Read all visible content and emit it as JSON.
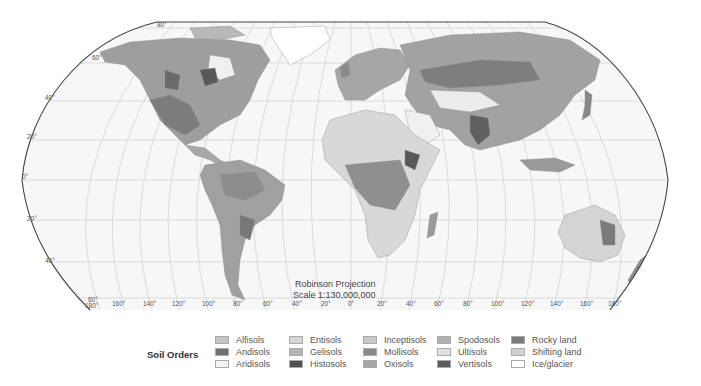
{
  "map": {
    "title": "Soil Orders",
    "projection_label": "Robinson Projection",
    "scale_label": "Scale 1:130,000,000",
    "ocean_color": "#f7f7f7",
    "graticule_color": "#c8c8c8",
    "border_color": "#444444",
    "latitude_labels": [
      {
        "text": "80°",
        "x": 157,
        "y": 27
      },
      {
        "text": "60°",
        "x": 92,
        "y": 60
      },
      {
        "text": "40°",
        "x": 45,
        "y": 100
      },
      {
        "text": "20°",
        "x": 27,
        "y": 139
      },
      {
        "text": "0°",
        "x": 22,
        "y": 179
      },
      {
        "text": "20°",
        "x": 27,
        "y": 221
      },
      {
        "text": "40°",
        "x": 45,
        "y": 263
      },
      {
        "text": "60°",
        "x": 88,
        "y": 302
      }
    ],
    "longitude_labels": [
      {
        "text": "180°",
        "x": 85
      },
      {
        "text": "160°",
        "x": 112
      },
      {
        "text": "140°",
        "x": 143
      },
      {
        "text": "120°",
        "x": 172
      },
      {
        "text": "100°",
        "x": 202
      },
      {
        "text": "80°",
        "x": 233
      },
      {
        "text": "60°",
        "x": 263
      },
      {
        "text": "40°",
        "x": 292
      },
      {
        "text": "20°",
        "x": 321
      },
      {
        "text": "0°",
        "x": 351
      },
      {
        "text": "20°",
        "x": 379
      },
      {
        "text": "40°",
        "x": 408
      },
      {
        "text": "60°",
        "x": 436
      },
      {
        "text": "80°",
        "x": 465
      },
      {
        "text": "100°",
        "x": 493
      },
      {
        "text": "120°",
        "x": 523
      },
      {
        "text": "140°",
        "x": 552
      },
      {
        "text": "160°",
        "x": 582
      },
      {
        "text": "180°",
        "x": 612
      }
    ]
  },
  "legend": {
    "title": "Soil Orders",
    "columns": [
      [
        {
          "label": "Alfisols",
          "color": "#c4c4c4"
        },
        {
          "label": "Andisols",
          "color": "#6f6f6f"
        },
        {
          "label": "Aridisols",
          "color": "#f4f4f4"
        }
      ],
      [
        {
          "label": "Entisols",
          "color": "#d6d6d6"
        },
        {
          "label": "Gelisols",
          "color": "#b4b4b4"
        },
        {
          "label": "Histosols",
          "color": "#505050"
        }
      ],
      [
        {
          "label": "Inceptisols",
          "color": "#c9c9c9"
        },
        {
          "label": "Mollisols",
          "color": "#8a8a8a"
        },
        {
          "label": "Oxisols",
          "color": "#a6a6a6"
        }
      ],
      [
        {
          "label": "Spodosols",
          "color": "#b0b0b0"
        },
        {
          "label": "Ultisols",
          "color": "#dedede"
        },
        {
          "label": "Vertisols",
          "color": "#5c5c5c"
        }
      ],
      [
        {
          "label": "Rocky land",
          "color": "#7a7a7a"
        },
        {
          "label": "Shifting land",
          "color": "#d0d0d0"
        },
        {
          "label": "Ice/glacier",
          "color": "#ffffff"
        }
      ]
    ]
  }
}
